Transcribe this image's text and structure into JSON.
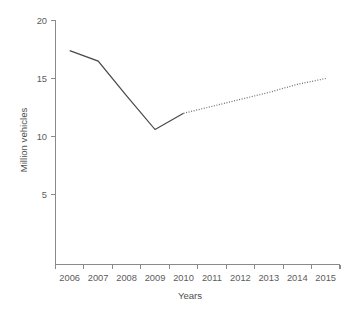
{
  "chart_data": {
    "type": "line",
    "title": "",
    "subtitle": "",
    "xlabel": "Years",
    "ylabel": "Million vehicles",
    "categories": [
      "2006",
      "2007",
      "2008",
      "2009",
      "2010",
      "2011",
      "2012",
      "2013",
      "2014",
      "2015"
    ],
    "xtick_labels": [
      "2006",
      "2007",
      "2008",
      "2009",
      "2010",
      "2011",
      "2012",
      "2013",
      "2014",
      "2015"
    ],
    "ytick_labels": [
      "20",
      "15",
      "10",
      "5"
    ],
    "ytick_values": [
      20,
      15,
      10,
      5
    ],
    "ylim": [
      0,
      20
    ],
    "grid": false,
    "legend": "none",
    "series": [
      {
        "name": "Actual (solid)",
        "style": "solid",
        "color": "#4a4a4a",
        "x": [
          "2006",
          "2007",
          "2008",
          "2009",
          "2010"
        ],
        "values": [
          17.4,
          16.5,
          13.5,
          10.6,
          12.0
        ]
      },
      {
        "name": "Forecast (dotted)",
        "style": "dotted",
        "color": "#6e6e6e",
        "x": [
          "2010",
          "2011",
          "2012",
          "2013",
          "2014",
          "2015"
        ],
        "values": [
          12.0,
          12.6,
          13.2,
          13.8,
          14.5,
          15.0
        ]
      }
    ],
    "annotations": []
  },
  "axes": {
    "y_axis_title": "Million vehicles",
    "x_axis_title": "Years",
    "y_ticks": [
      {
        "label": "20",
        "value": 20
      },
      {
        "label": "15",
        "value": 15
      },
      {
        "label": "10",
        "value": 10
      },
      {
        "label": "5",
        "value": 5
      }
    ],
    "x_ticks": [
      {
        "label": "2006"
      },
      {
        "label": "2007"
      },
      {
        "label": "2008"
      },
      {
        "label": "2009"
      },
      {
        "label": "2010"
      },
      {
        "label": "2011"
      },
      {
        "label": "2012"
      },
      {
        "label": "2013"
      },
      {
        "label": "2014"
      },
      {
        "label": "2015"
      }
    ]
  },
  "colors": {
    "background": "#ffffff",
    "axis": "#8a8a8a",
    "solid_line": "#4a4a4a",
    "dotted_line": "#6e6e6e",
    "tick_text": "#5c5c5c",
    "title_text": "#4f4f4f"
  }
}
